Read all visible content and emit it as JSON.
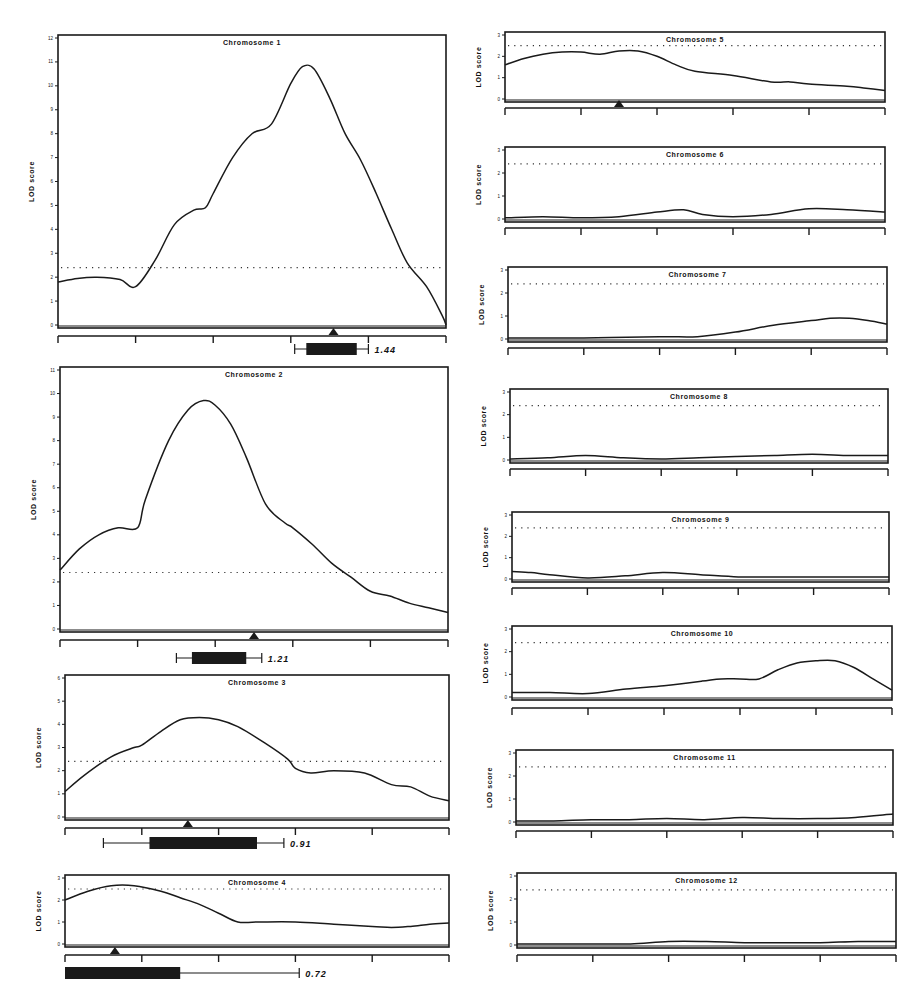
{
  "chart_data": [
    {
      "type": "line",
      "title": "Chromosome 1",
      "ylabel": "LOD score",
      "xlabel": "",
      "ylim": [
        0,
        12
      ],
      "yticks": [
        0,
        1,
        2,
        3,
        4,
        5,
        6,
        7,
        8,
        9,
        10,
        11,
        12
      ],
      "x": [
        0,
        0.05,
        0.1,
        0.16,
        0.2,
        0.25,
        0.3,
        0.35,
        0.38,
        0.4,
        0.45,
        0.5,
        0.55,
        0.6,
        0.63,
        0.66,
        0.7,
        0.74,
        0.78,
        0.82,
        0.86,
        0.9,
        0.95,
        0.99,
        1.0
      ],
      "values": [
        1.8,
        1.95,
        2.0,
        1.9,
        1.6,
        2.7,
        4.2,
        4.8,
        4.9,
        5.5,
        7.0,
        8.0,
        8.4,
        10.1,
        10.8,
        10.7,
        9.5,
        8.0,
        6.9,
        5.5,
        4.0,
        2.6,
        1.6,
        0.4,
        0.0
      ],
      "threshold": 2.4,
      "marker_x": 0.71,
      "ci": {
        "whisker_low": 0.61,
        "box_low": 0.64,
        "box_high": 0.77,
        "whisker_high": 0.8,
        "label": "1.44"
      },
      "xticks": 6,
      "grid": false,
      "legend": "none"
    },
    {
      "type": "line",
      "title": "Chromosome 2",
      "ylabel": "LOD score",
      "xlabel": "",
      "ylim": [
        0,
        11
      ],
      "yticks": [
        0,
        1,
        2,
        3,
        4,
        5,
        6,
        7,
        8,
        9,
        10,
        11
      ],
      "x": [
        0,
        0.05,
        0.1,
        0.15,
        0.2,
        0.22,
        0.28,
        0.33,
        0.37,
        0.4,
        0.44,
        0.48,
        0.53,
        0.58,
        0.6,
        0.65,
        0.7,
        0.75,
        0.8,
        0.85,
        0.9,
        0.95,
        1.0
      ],
      "values": [
        2.5,
        3.4,
        4.0,
        4.3,
        4.3,
        5.5,
        8.0,
        9.3,
        9.7,
        9.5,
        8.7,
        7.3,
        5.3,
        4.5,
        4.3,
        3.6,
        2.8,
        2.2,
        1.6,
        1.4,
        1.1,
        0.9,
        0.7
      ],
      "threshold": 2.4,
      "marker_x": 0.5,
      "ci": {
        "whisker_low": 0.3,
        "box_low": 0.34,
        "box_high": 0.48,
        "whisker_high": 0.52,
        "label": "1.21"
      },
      "xticks": 6,
      "grid": false,
      "legend": "none"
    },
    {
      "type": "line",
      "title": "Chromosome 3",
      "ylabel": "LOD score",
      "xlabel": "",
      "ylim": [
        0,
        6
      ],
      "yticks": [
        0,
        1,
        2,
        3,
        4,
        5,
        6
      ],
      "x": [
        0,
        0.05,
        0.12,
        0.18,
        0.2,
        0.25,
        0.3,
        0.35,
        0.4,
        0.45,
        0.52,
        0.58,
        0.6,
        0.64,
        0.7,
        0.78,
        0.85,
        0.9,
        0.95,
        1.0
      ],
      "values": [
        1.1,
        1.8,
        2.6,
        3.0,
        3.1,
        3.7,
        4.2,
        4.3,
        4.2,
        3.9,
        3.2,
        2.5,
        2.1,
        1.9,
        2.0,
        1.9,
        1.4,
        1.3,
        0.9,
        0.7
      ],
      "threshold": 2.4,
      "marker_x": 0.32,
      "ci": {
        "whisker_low": 0.1,
        "box_low": 0.22,
        "box_high": 0.5,
        "whisker_high": 0.57,
        "label": "0.91"
      },
      "xticks": 6,
      "grid": false,
      "legend": "none"
    },
    {
      "type": "line",
      "title": "Chromosome 4",
      "ylabel": "LOD score",
      "xlabel": "",
      "ylim": [
        0,
        3
      ],
      "yticks": [
        0,
        1,
        2,
        3
      ],
      "x": [
        0,
        0.06,
        0.12,
        0.18,
        0.25,
        0.3,
        0.35,
        0.4,
        0.45,
        0.5,
        0.6,
        0.7,
        0.8,
        0.85,
        0.9,
        0.95,
        1.0
      ],
      "values": [
        2.0,
        2.4,
        2.65,
        2.65,
        2.4,
        2.1,
        1.8,
        1.4,
        1.0,
        1.0,
        1.0,
        0.9,
        0.8,
        0.75,
        0.8,
        0.9,
        0.95
      ],
      "threshold": 2.5,
      "marker_x": 0.13,
      "ci": {
        "whisker_low": 0.0,
        "box_low": 0.0,
        "box_high": 0.3,
        "whisker_high": 0.61,
        "label": "0.72"
      },
      "xticks": 6,
      "grid": false,
      "legend": "none"
    },
    {
      "type": "line",
      "title": "Chromosome 5",
      "ylabel": "LOD score",
      "xlabel": "",
      "ylim": [
        0,
        3
      ],
      "yticks": [
        0,
        1,
        2,
        3
      ],
      "x": [
        0,
        0.05,
        0.1,
        0.15,
        0.2,
        0.25,
        0.3,
        0.35,
        0.4,
        0.45,
        0.5,
        0.6,
        0.7,
        0.75,
        0.8,
        0.9,
        0.95,
        1.0
      ],
      "values": [
        1.6,
        1.9,
        2.1,
        2.2,
        2.2,
        2.1,
        2.25,
        2.25,
        2.0,
        1.6,
        1.3,
        1.1,
        0.8,
        0.8,
        0.7,
        0.6,
        0.5,
        0.4
      ],
      "threshold": 2.5,
      "marker_x": 0.3,
      "xticks": 6,
      "grid": false,
      "legend": "none"
    },
    {
      "type": "line",
      "title": "Chromosome 6",
      "ylabel": "LOD score",
      "xlabel": "",
      "ylim": [
        0,
        3
      ],
      "yticks": [
        0,
        1,
        2,
        3
      ],
      "x": [
        0,
        0.1,
        0.2,
        0.3,
        0.4,
        0.47,
        0.52,
        0.6,
        0.7,
        0.8,
        0.9,
        1.0
      ],
      "values": [
        0.05,
        0.1,
        0.05,
        0.1,
        0.3,
        0.4,
        0.2,
        0.1,
        0.2,
        0.45,
        0.4,
        0.3
      ],
      "threshold": 2.4,
      "xticks": 6,
      "grid": false,
      "legend": "none"
    },
    {
      "type": "line",
      "title": "Chromosome 7",
      "ylabel": "LOD score",
      "xlabel": "",
      "ylim": [
        0,
        3
      ],
      "yticks": [
        0,
        1,
        2,
        3
      ],
      "x": [
        0,
        0.2,
        0.4,
        0.5,
        0.6,
        0.7,
        0.8,
        0.85,
        0.9,
        0.95,
        1.0
      ],
      "values": [
        0.05,
        0.05,
        0.1,
        0.1,
        0.3,
        0.6,
        0.8,
        0.9,
        0.9,
        0.8,
        0.65
      ],
      "threshold": 2.4,
      "xticks": 6,
      "grid": false,
      "legend": "none"
    },
    {
      "type": "line",
      "title": "Chromosome 8",
      "ylabel": "LOD score",
      "xlabel": "",
      "ylim": [
        0,
        3
      ],
      "yticks": [
        0,
        1,
        2,
        3
      ],
      "x": [
        0,
        0.1,
        0.2,
        0.3,
        0.4,
        0.5,
        0.6,
        0.7,
        0.8,
        0.9,
        1.0
      ],
      "values": [
        0.05,
        0.1,
        0.2,
        0.1,
        0.05,
        0.1,
        0.15,
        0.2,
        0.25,
        0.2,
        0.2
      ],
      "threshold": 2.4,
      "xticks": 6,
      "grid": false,
      "legend": "none"
    },
    {
      "type": "line",
      "title": "Chromosome 9",
      "ylabel": "LOD score",
      "xlabel": "",
      "ylim": [
        0,
        3
      ],
      "yticks": [
        0,
        1,
        2,
        3
      ],
      "x": [
        0,
        0.05,
        0.1,
        0.2,
        0.3,
        0.4,
        0.5,
        0.6,
        0.7,
        0.8,
        0.9,
        1.0
      ],
      "values": [
        0.35,
        0.3,
        0.2,
        0.05,
        0.15,
        0.3,
        0.2,
        0.1,
        0.1,
        0.1,
        0.1,
        0.1
      ],
      "threshold": 2.4,
      "xticks": 6,
      "grid": false,
      "legend": "none"
    },
    {
      "type": "line",
      "title": "Chromosome 10",
      "ylabel": "LOD score",
      "xlabel": "",
      "ylim": [
        0,
        3
      ],
      "yticks": [
        0,
        1,
        2,
        3
      ],
      "x": [
        0,
        0.1,
        0.2,
        0.3,
        0.4,
        0.5,
        0.55,
        0.6,
        0.65,
        0.7,
        0.75,
        0.8,
        0.85,
        0.9,
        0.95,
        1.0
      ],
      "values": [
        0.2,
        0.2,
        0.15,
        0.35,
        0.5,
        0.7,
        0.8,
        0.8,
        0.8,
        1.2,
        1.5,
        1.6,
        1.6,
        1.3,
        0.8,
        0.3
      ],
      "threshold": 2.4,
      "xticks": 6,
      "grid": false,
      "legend": "none"
    },
    {
      "type": "line",
      "title": "Chromosome 11",
      "ylabel": "LOD score",
      "xlabel": "",
      "ylim": [
        0,
        3
      ],
      "yticks": [
        0,
        1,
        2,
        3
      ],
      "x": [
        0,
        0.1,
        0.2,
        0.3,
        0.4,
        0.5,
        0.6,
        0.7,
        0.8,
        0.9,
        1.0
      ],
      "values": [
        0.05,
        0.05,
        0.1,
        0.1,
        0.15,
        0.1,
        0.2,
        0.15,
        0.15,
        0.2,
        0.35
      ],
      "threshold": 2.4,
      "xticks": 6,
      "grid": false,
      "legend": "none"
    },
    {
      "type": "line",
      "title": "Chromosome 12",
      "ylabel": "LOD score",
      "xlabel": "",
      "ylim": [
        0,
        3
      ],
      "yticks": [
        0,
        1,
        2,
        3
      ],
      "x": [
        0,
        0.1,
        0.2,
        0.3,
        0.4,
        0.5,
        0.6,
        0.7,
        0.8,
        0.9,
        1.0
      ],
      "values": [
        0.05,
        0.05,
        0.05,
        0.05,
        0.15,
        0.15,
        0.1,
        0.1,
        0.1,
        0.15,
        0.15
      ],
      "threshold": 2.4,
      "xticks": 6,
      "grid": false,
      "legend": "none"
    }
  ]
}
